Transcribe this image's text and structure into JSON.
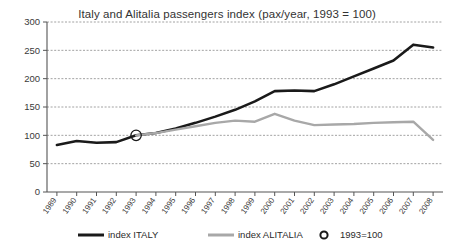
{
  "chart_data": {
    "type": "line",
    "title": "Italy and Alitalia passengers index (pax/year, 1993 = 100)",
    "xlabel": "",
    "ylabel": "",
    "ylim": [
      0,
      300
    ],
    "yticks": [
      0,
      50,
      100,
      150,
      200,
      250,
      300
    ],
    "grid": true,
    "legend_position": "bottom",
    "x": [
      1989,
      1990,
      1991,
      1992,
      1993,
      1994,
      1995,
      1996,
      1997,
      1998,
      1999,
      2000,
      2001,
      2002,
      2003,
      2004,
      2005,
      2006,
      2007,
      2008
    ],
    "categories": [
      "1989",
      "1990",
      "1991",
      "1992",
      "1993",
      "1994",
      "1995",
      "1996",
      "1997",
      "1998",
      "1999",
      "2000",
      "2001",
      "2002",
      "2003",
      "2004",
      "2005",
      "2006",
      "2007",
      "2008"
    ],
    "series": [
      {
        "name": "index ITALY",
        "color": "#1a1a1a",
        "values": [
          83,
          90,
          87,
          88,
          100,
          104,
          112,
          122,
          133,
          145,
          160,
          178,
          179,
          178,
          190,
          204,
          218,
          232,
          260,
          255
        ]
      },
      {
        "name": "index ALITALIA",
        "color": "#a8a8a8",
        "values": [
          null,
          null,
          null,
          null,
          100,
          104,
          110,
          116,
          122,
          126,
          124,
          138,
          126,
          118,
          119,
          120,
          122,
          123,
          124,
          92
        ]
      }
    ],
    "annotations": [
      {
        "label": "1993=100",
        "x": 1993,
        "y": 100,
        "marker": "circle"
      }
    ]
  },
  "legend": {
    "items": [
      {
        "label": "index ITALY",
        "marker": "thick-line",
        "color": "#1a1a1a"
      },
      {
        "label": "index ALITALIA",
        "marker": "thick-line",
        "color": "#a8a8a8"
      },
      {
        "label": "1993=100",
        "marker": "circle-outline",
        "color": "#1a1a1a"
      }
    ]
  }
}
